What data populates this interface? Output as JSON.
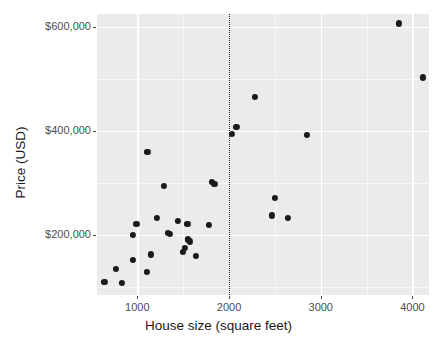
{
  "chart_data": {
    "type": "scatter",
    "title": "",
    "xlabel": "House size (square feet)",
    "ylabel": "Price (USD)",
    "xlim": [
      560,
      4180
    ],
    "ylim": [
      85000,
      625000
    ],
    "xticks": [
      1000,
      2000,
      3000,
      4000
    ],
    "xtick_labels": [
      "1000",
      "2000",
      "3000",
      "4000"
    ],
    "yticks": [
      200000,
      400000,
      600000
    ],
    "ytick_labels": [
      "$200,000",
      "$400,000",
      "$600,000"
    ],
    "grid": true,
    "grid_color": "#ffffff",
    "panel_background": "#ebebeb",
    "point_color": "#1a1a1a",
    "legend": null,
    "annotations": [
      {
        "type": "vertical-line",
        "name": "reference-line-2000-sqft",
        "x": 2000,
        "style": "dotted",
        "color": "#1a1a1a"
      }
    ],
    "points": [
      {
        "x": 640,
        "y": 110000
      },
      {
        "x": 770,
        "y": 135000
      },
      {
        "x": 830,
        "y": 108000
      },
      {
        "x": 950,
        "y": 200000
      },
      {
        "x": 955,
        "y": 152000
      },
      {
        "x": 990,
        "y": 221000
      },
      {
        "x": 1100,
        "y": 130000
      },
      {
        "x": 1110,
        "y": 360000
      },
      {
        "x": 1145,
        "y": 163000
      },
      {
        "x": 1210,
        "y": 233000
      },
      {
        "x": 1290,
        "y": 295000
      },
      {
        "x": 1330,
        "y": 205000
      },
      {
        "x": 1355,
        "y": 202000
      },
      {
        "x": 1445,
        "y": 228000
      },
      {
        "x": 1500,
        "y": 168000
      },
      {
        "x": 1520,
        "y": 175000
      },
      {
        "x": 1545,
        "y": 222000
      },
      {
        "x": 1555,
        "y": 192000
      },
      {
        "x": 1575,
        "y": 188000
      },
      {
        "x": 1640,
        "y": 160000
      },
      {
        "x": 1780,
        "y": 220000
      },
      {
        "x": 1810,
        "y": 302000
      },
      {
        "x": 1840,
        "y": 298000
      },
      {
        "x": 2030,
        "y": 394000
      },
      {
        "x": 2080,
        "y": 408000
      },
      {
        "x": 2285,
        "y": 466000
      },
      {
        "x": 2470,
        "y": 238000
      },
      {
        "x": 2500,
        "y": 272000
      },
      {
        "x": 2645,
        "y": 233000
      },
      {
        "x": 2850,
        "y": 392000
      },
      {
        "x": 3855,
        "y": 607000
      },
      {
        "x": 4110,
        "y": 503000
      }
    ]
  },
  "background_text": {
    "lines": [
      "these faint lines are show-through text from the page behind",
      "House size (square feet)",
      "median house price in the",
      "the observed values of",
      "house price and size data",
      "in thousands of dollars"
    ]
  }
}
